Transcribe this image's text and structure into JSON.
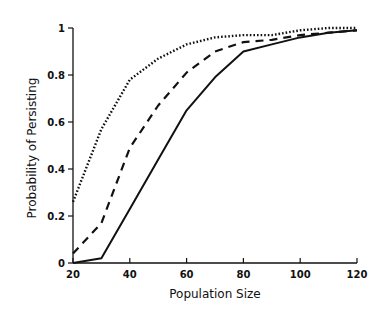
{
  "chart_data": {
    "type": "line",
    "title": "",
    "xlabel": "Population Size",
    "ylabel": "Probability of Persisting",
    "xlim": [
      20,
      120
    ],
    "ylim": [
      0,
      1
    ],
    "x_ticks": [
      20,
      40,
      60,
      80,
      100,
      120
    ],
    "y_ticks": [
      0,
      0.2,
      0.4,
      0.6,
      0.8,
      1
    ],
    "y_tick_labels": [
      "0",
      "0.2",
      "0.4",
      "0.6",
      "0.8",
      "1"
    ],
    "grid": false,
    "legend": null,
    "series": [
      {
        "name": "dotted",
        "style": "dotted",
        "x": [
          20,
          30,
          40,
          50,
          60,
          70,
          80,
          90,
          100,
          110,
          120
        ],
        "values": [
          0.26,
          0.57,
          0.78,
          0.87,
          0.93,
          0.96,
          0.97,
          0.97,
          0.99,
          1.0,
          1.0
        ]
      },
      {
        "name": "dashed",
        "style": "dashed",
        "x": [
          20,
          30,
          40,
          50,
          60,
          70,
          80,
          90,
          100,
          110,
          120
        ],
        "values": [
          0.04,
          0.17,
          0.49,
          0.67,
          0.81,
          0.9,
          0.94,
          0.95,
          0.97,
          0.98,
          0.99
        ]
      },
      {
        "name": "solid",
        "style": "solid",
        "x": [
          20,
          30,
          40,
          50,
          60,
          70,
          80,
          90,
          100,
          110,
          120
        ],
        "values": [
          0.0,
          0.02,
          0.23,
          0.44,
          0.65,
          0.79,
          0.9,
          0.93,
          0.96,
          0.98,
          0.99
        ]
      }
    ]
  }
}
